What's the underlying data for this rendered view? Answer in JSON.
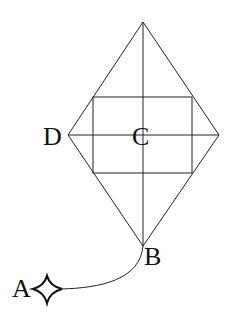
{
  "diagram": {
    "labels": {
      "A": "A",
      "B": "B",
      "C": "C",
      "D": "D"
    },
    "points": {
      "top": [
        143,
        22
      ],
      "left_D": [
        68,
        135
      ],
      "right": [
        219,
        135
      ],
      "bottom_B": [
        143,
        246
      ],
      "center_C": [
        143,
        135
      ],
      "A_star": [
        47,
        289
      ]
    },
    "rectangle": {
      "x1": 93,
      "y1": 97,
      "x2": 192,
      "y2": 173
    },
    "colors": {
      "stroke": "#222222",
      "background": "#ffffff",
      "text": "#111111"
    },
    "icons": {
      "anchor": "four-point-star-icon"
    }
  }
}
